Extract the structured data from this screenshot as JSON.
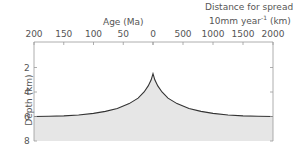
{
  "chart_data": {
    "type": "area",
    "title": "",
    "top_axis_left": {
      "label": "Age (Ma)",
      "ticks": [
        200,
        150,
        100,
        50,
        0
      ],
      "range": [
        200,
        0
      ]
    },
    "top_axis_right": {
      "label_line1": "Distance for spreading rate of",
      "label_line2_base": "10mm year",
      "label_line2_sup": "-1",
      "label_line2_unit": " (km)",
      "ticks": [
        0,
        500,
        1000,
        1500,
        2000
      ],
      "range": [
        0,
        2000
      ]
    },
    "ylabel": "Depth (km)",
    "yticks": [
      2,
      4,
      6,
      8
    ],
    "ylim": [
      0,
      8
    ],
    "y_inverted": true,
    "grid": false,
    "fill_color": "#e6e6e6",
    "line_color": "#333333",
    "series": [
      {
        "name": "Ocean floor depth vs age (left, Ma)",
        "x": [
          200,
          175,
          150,
          125,
          100,
          80,
          60,
          40,
          25,
          15,
          8,
          3,
          0
        ],
        "values": [
          6.0,
          5.98,
          5.95,
          5.88,
          5.75,
          5.58,
          5.35,
          4.95,
          4.5,
          4.0,
          3.5,
          3.0,
          2.5
        ]
      },
      {
        "name": "Ocean floor depth vs distance (right, km)",
        "x": [
          0,
          30,
          80,
          150,
          250,
          400,
          600,
          800,
          1000,
          1250,
          1500,
          1750,
          2000
        ],
        "values": [
          2.5,
          3.0,
          3.5,
          4.0,
          4.5,
          4.95,
          5.35,
          5.58,
          5.75,
          5.88,
          5.95,
          5.98,
          6.0
        ]
      }
    ]
  }
}
